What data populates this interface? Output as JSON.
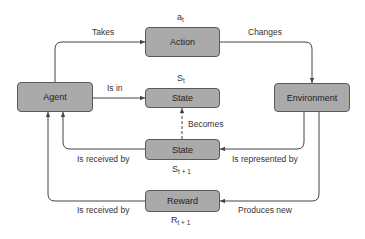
{
  "nodes": {
    "agent": {
      "label": "Agent"
    },
    "action": {
      "label": "Action",
      "symbol": "a",
      "symbol_sub": "t"
    },
    "state_t": {
      "label": "State",
      "symbol": "S",
      "symbol_sub": "t"
    },
    "environment": {
      "label": "Environment"
    },
    "state_next": {
      "label": "State",
      "symbol": "S",
      "symbol_sub": "t + 1"
    },
    "reward": {
      "label": "Reward",
      "symbol": "R",
      "symbol_sub": "t + 1"
    }
  },
  "edges": {
    "takes": "Takes",
    "changes": "Changes",
    "is_in": "Is in",
    "becomes": "Becomes",
    "state_received": "Is received by",
    "represented": "Is represented by",
    "reward_received": "Is received by",
    "produces": "Produces new"
  },
  "colors": {
    "box_fill": "#aaaaaa",
    "box_border": "#5a5a5a",
    "line": "#444444"
  }
}
